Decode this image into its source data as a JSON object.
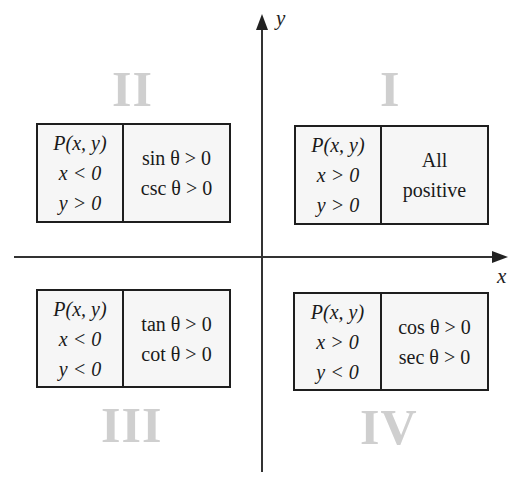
{
  "axes": {
    "x_label": "x",
    "y_label": "y"
  },
  "quadrants": [
    {
      "numeral": "I",
      "point": "P(x, y)",
      "x_cond": "x > 0",
      "y_cond": "y > 0",
      "sign_lines": [
        "All",
        "positive"
      ]
    },
    {
      "numeral": "II",
      "point": "P(x, y)",
      "x_cond": "x < 0",
      "y_cond": "y > 0",
      "sign_lines": [
        "sin θ > 0",
        "csc θ > 0"
      ]
    },
    {
      "numeral": "III",
      "point": "P(x, y)",
      "x_cond": "x < 0",
      "y_cond": "y < 0",
      "sign_lines": [
        "tan θ > 0",
        "cot θ > 0"
      ]
    },
    {
      "numeral": "IV",
      "point": "P(x, y)",
      "x_cond": "x > 0",
      "y_cond": "y < 0",
      "sign_lines": [
        "cos θ > 0",
        "sec θ > 0"
      ]
    }
  ],
  "colors": {
    "numeral": "#cfcfcf",
    "box_fill": "#f6f6f6",
    "line": "#1e1e1e"
  }
}
